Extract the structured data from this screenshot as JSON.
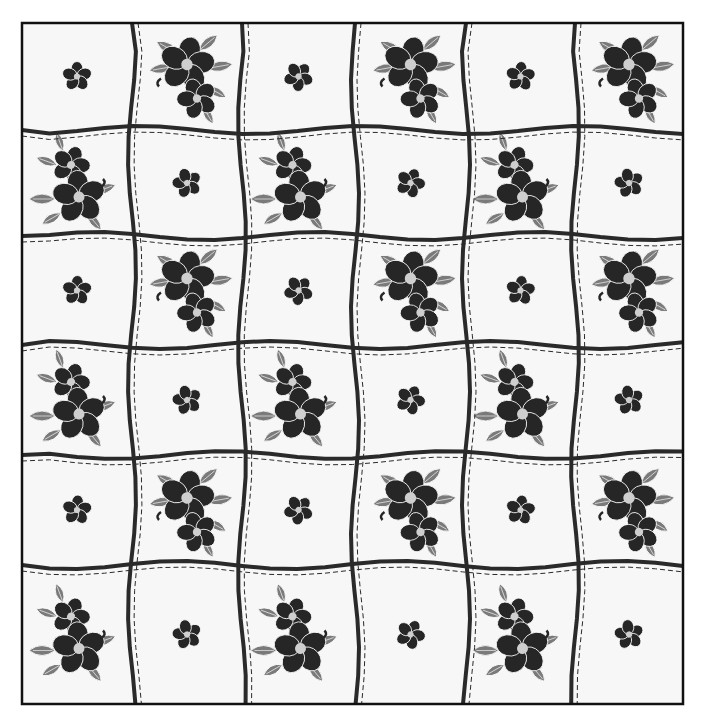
{
  "image": {
    "description": "Grayscale quilt pattern with floral appliqué blocks separated by wavy ribbon sashing with dashed stitching",
    "grid": {
      "rows": 6,
      "cols": 6
    },
    "frame": {
      "x": 22,
      "y": 23,
      "width": 661,
      "height": 681
    },
    "col_edges": [
      22,
      132,
      242,
      355,
      466,
      575,
      683
    ],
    "row_edges": [
      23,
      130,
      236,
      345,
      455,
      565,
      704
    ],
    "blocks": [
      [
        "small",
        "large",
        "small",
        "large",
        "small",
        "large"
      ],
      [
        "large",
        "small",
        "large",
        "small",
        "large",
        "small"
      ],
      [
        "small",
        "large",
        "small",
        "large",
        "small",
        "large"
      ],
      [
        "large",
        "small",
        "large",
        "small",
        "large",
        "small"
      ],
      [
        "small",
        "large",
        "small",
        "large",
        "small",
        "large"
      ],
      [
        "large",
        "small",
        "large",
        "small",
        "large",
        "small"
      ]
    ],
    "colors": {
      "background": "#ffffff",
      "block_fill": "#f7f7f7",
      "ribbon": "#2a2a2a",
      "flower_dark": "#262626",
      "leaf_gray": "#7a7a7a",
      "flower_center": "#cfcfcf",
      "frame": "#111111"
    }
  }
}
